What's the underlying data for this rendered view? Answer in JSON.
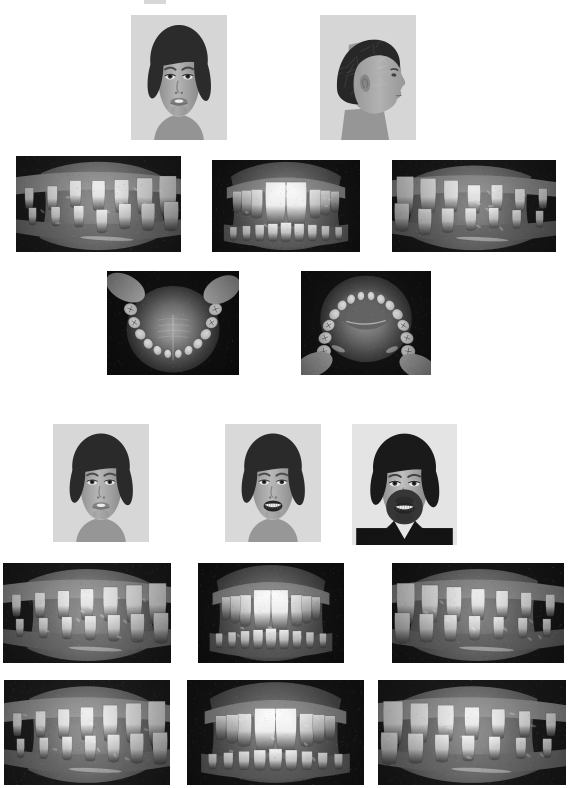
{
  "document": {
    "title": "Orthodontic Case Photographic Series",
    "page_background": "#ffffff",
    "width": 572,
    "height": 788,
    "content_type": "grayscale clinical photograph composite",
    "top_fragment_note": "partial cropped dark mark at top edge of page"
  },
  "sections": [
    {
      "id": "pretreatment",
      "label": "Pretreatment records",
      "rows": [
        {
          "id": "pre-extraoral",
          "label": "Pretreatment extraoral photographs"
        },
        {
          "id": "pre-intraoral",
          "label": "Pretreatment intraoral photographs"
        },
        {
          "id": "pre-occlusal",
          "label": "Pretreatment occlusal photographs"
        }
      ]
    },
    {
      "id": "posttreatment",
      "label": "Posttreatment and long-term records",
      "rows": [
        {
          "id": "post-extraoral",
          "label": "Posttreatment and follow-up extraoral photographs"
        },
        {
          "id": "post-intraoral-a",
          "label": "Posttreatment intraoral photographs"
        },
        {
          "id": "post-intraoral-b",
          "label": "Long-term follow-up intraoral photographs"
        }
      ]
    }
  ],
  "photos": [
    {
      "id": "p1",
      "name": "pretreatment-frontal-face-photo",
      "description": "Pretreatment frontal facial photograph, adolescent boy, lips apart, incisors visible",
      "view": "frontal face",
      "x": 131,
      "y": 15,
      "w": 96,
      "h": 125,
      "palette": {
        "bg": "#d8d7d2",
        "hair": "#2f2a26",
        "skin": "#b9ada2",
        "shadow": "#6a6159"
      },
      "kind": "face-front"
    },
    {
      "id": "p2",
      "name": "pretreatment-profile-face-photo",
      "description": "Pretreatment right profile facial photograph, convex profile",
      "view": "profile face",
      "x": 320,
      "y": 15,
      "w": 96,
      "h": 125,
      "palette": {
        "bg": "#d8d7d2",
        "hair": "#2b2723",
        "skin": "#b7aba0",
        "shadow": "#67605a"
      },
      "kind": "face-profile"
    },
    {
      "id": "p3",
      "name": "pretreatment-right-buccal-photo",
      "description": "Pretreatment right buccal intraoral view showing overjet and spacing",
      "view": "right buccal",
      "x": 16,
      "y": 156,
      "w": 165,
      "h": 96,
      "palette": {
        "bg": "#4c4440",
        "teeth": "#e8e2d6",
        "gingiva": "#9a8a82",
        "dark": "#221e1c"
      },
      "kind": "buccal-right"
    },
    {
      "id": "p4",
      "name": "pretreatment-frontal-intraoral-photo",
      "description": "Pretreatment frontal intraoral view, prominent maxillary central incisors, deep overbite",
      "view": "frontal intraoral",
      "x": 212,
      "y": 160,
      "w": 148,
      "h": 92,
      "palette": {
        "bg": "#3a3431",
        "teeth": "#f2eee4",
        "gingiva": "#94837c",
        "dark": "#1b1817"
      },
      "kind": "frontal-intraoral"
    },
    {
      "id": "p5",
      "name": "pretreatment-left-buccal-photo",
      "description": "Pretreatment left buccal intraoral view",
      "view": "left buccal",
      "x": 392,
      "y": 160,
      "w": 164,
      "h": 92,
      "palette": {
        "bg": "#46403c",
        "teeth": "#e3ddd1",
        "gingiva": "#8f817a",
        "dark": "#1e1b19"
      },
      "kind": "buccal-left"
    },
    {
      "id": "p6",
      "name": "pretreatment-maxillary-occlusal-photo",
      "description": "Pretreatment maxillary occlusal view showing arch form and palate",
      "view": "maxillary occlusal",
      "x": 107,
      "y": 271,
      "w": 132,
      "h": 104,
      "palette": {
        "bg": "#2a2522",
        "teeth": "#ded8cc",
        "gingiva": "#9d8d85",
        "dark": "#141211"
      },
      "kind": "occlusal-upper"
    },
    {
      "id": "p7",
      "name": "pretreatment-mandibular-occlusal-photo",
      "description": "Pretreatment mandibular occlusal view showing arch form and tongue",
      "view": "mandibular occlusal",
      "x": 301,
      "y": 271,
      "w": 130,
      "h": 104,
      "palette": {
        "bg": "#2f2a27",
        "teeth": "#d9d2c6",
        "gingiva": "#9b8b83",
        "dark": "#171514"
      },
      "kind": "occlusal-lower"
    },
    {
      "id": "p8",
      "name": "posttreatment-frontal-face-photo",
      "description": "Posttreatment frontal facial photograph at rest, adolescent boy",
      "view": "frontal face at rest",
      "x": 53,
      "y": 424,
      "w": 96,
      "h": 118,
      "palette": {
        "bg": "#d9d8d3",
        "hair": "#2e2a26",
        "skin": "#bbafa4",
        "shadow": "#6c635b"
      },
      "kind": "face-front"
    },
    {
      "id": "p9",
      "name": "posttreatment-smiling-face-photo",
      "description": "Posttreatment frontal facial photograph smiling, adolescent boy",
      "view": "frontal face smiling",
      "x": 225,
      "y": 424,
      "w": 96,
      "h": 118,
      "palette": {
        "bg": "#dbdad5",
        "hair": "#2e2a26",
        "skin": "#bcb0a5",
        "shadow": "#6c635b"
      },
      "kind": "face-smile"
    },
    {
      "id": "p10",
      "name": "longterm-adult-face-photo",
      "description": "Long-term follow-up facial photograph, adult male with beard wearing dark suit and tie, smiling",
      "view": "frontal face adult smiling",
      "x": 352,
      "y": 424,
      "w": 105,
      "h": 121,
      "palette": {
        "bg": "#e6e5e2",
        "hair": "#1d1a18",
        "skin": "#c3b8ad",
        "shadow": "#5c544e"
      },
      "kind": "face-adult"
    },
    {
      "id": "p11",
      "name": "posttreatment-right-buccal-photo-a",
      "description": "Posttreatment right buccal intraoral view, improved alignment",
      "view": "right buccal",
      "x": 3,
      "y": 563,
      "w": 168,
      "h": 100,
      "palette": {
        "bg": "#4a433f",
        "teeth": "#e9e3d7",
        "gingiva": "#9b8b83",
        "dark": "#211d1b"
      },
      "kind": "buccal-right"
    },
    {
      "id": "p12",
      "name": "posttreatment-frontal-intraoral-photo-a",
      "description": "Posttreatment frontal intraoral view, corrected incisor relationship",
      "view": "frontal intraoral",
      "x": 198,
      "y": 563,
      "w": 146,
      "h": 100,
      "palette": {
        "bg": "#332e2b",
        "teeth": "#f0ece2",
        "gingiva": "#8e7e78",
        "dark": "#181615"
      },
      "kind": "frontal-intraoral"
    },
    {
      "id": "p13",
      "name": "posttreatment-left-buccal-photo-a",
      "description": "Posttreatment left buccal intraoral view",
      "view": "left buccal",
      "x": 392,
      "y": 563,
      "w": 172,
      "h": 100,
      "palette": {
        "bg": "#433d39",
        "teeth": "#e6e0d4",
        "gingiva": "#8c7e77",
        "dark": "#1c1917"
      },
      "kind": "buccal-left"
    },
    {
      "id": "p14",
      "name": "longterm-right-buccal-photo",
      "description": "Long-term follow-up right buccal intraoral view, stable Class I occlusion",
      "view": "right buccal",
      "x": 4,
      "y": 680,
      "w": 166,
      "h": 105,
      "palette": {
        "bg": "#4e4743",
        "teeth": "#ece6da",
        "gingiva": "#9d8d85",
        "dark": "#232020"
      },
      "kind": "buccal-right"
    },
    {
      "id": "p15",
      "name": "longterm-frontal-intraoral-photo",
      "description": "Long-term follow-up frontal intraoral view, aligned dentition",
      "view": "frontal intraoral",
      "x": 187,
      "y": 680,
      "w": 177,
      "h": 105,
      "palette": {
        "bg": "#342f2c",
        "teeth": "#f3efe6",
        "gingiva": "#8f807a",
        "dark": "#1a1817"
      },
      "kind": "frontal-intraoral"
    },
    {
      "id": "p16",
      "name": "longterm-left-buccal-photo",
      "description": "Long-term follow-up left buccal intraoral view",
      "view": "left buccal",
      "x": 378,
      "y": 680,
      "w": 188,
      "h": 105,
      "palette": {
        "bg": "#474039",
        "teeth": "#efe9dd",
        "gingiva": "#9a8a82",
        "dark": "#201d1b"
      },
      "kind": "buccal-left"
    }
  ],
  "top_fragment": {
    "x": 144,
    "y": 0,
    "w": 22,
    "h": 4
  }
}
